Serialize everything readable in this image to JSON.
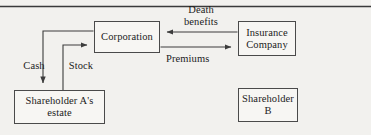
{
  "figure": {
    "kind": "flow-diagram",
    "background_color": "#f2f1ee",
    "line_color": "#4a4a4a",
    "text_color": "#1c1c1c"
  },
  "top_rule": {
    "present": true
  },
  "nodes": [
    {
      "id": "corporation",
      "label": "Corporation"
    },
    {
      "id": "insurance",
      "label": "Insurance\nCompany"
    },
    {
      "id": "estate",
      "label": "Shareholder A's\nestate"
    },
    {
      "id": "shareholder_b",
      "label": "Shareholder\nB"
    }
  ],
  "edges": [
    {
      "id": "death_benefits",
      "label": "Death\nbenefits",
      "from": "insurance",
      "to": "corporation"
    },
    {
      "id": "premiums",
      "label": "Premiums",
      "from": "corporation",
      "to": "insurance"
    },
    {
      "id": "cash",
      "label": "Cash",
      "from": "corporation",
      "to": "estate"
    },
    {
      "id": "stock",
      "label": "Stock",
      "from": "estate",
      "to": "corporation"
    }
  ]
}
